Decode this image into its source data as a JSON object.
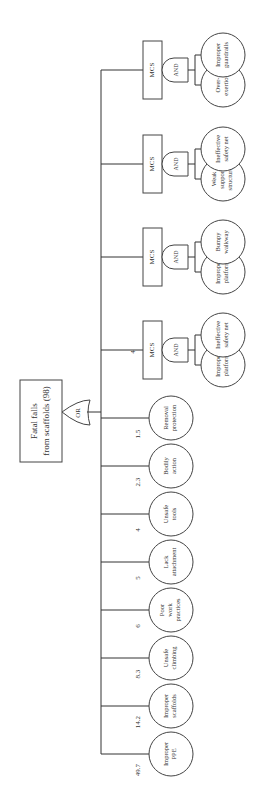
{
  "diagram": {
    "type": "fault-tree",
    "orientation": "rotated-90-ccw",
    "top_event": {
      "line1": "Fatal falls",
      "line2": "from scaffolds (98)"
    },
    "top_gate": "OR",
    "basic_events": [
      {
        "lines": [
          "Improper",
          "PPE"
        ],
        "value": "49.7"
      },
      {
        "lines": [
          "Improper",
          "scaffolds"
        ],
        "value": "14.2"
      },
      {
        "lines": [
          "Unsafe",
          "climbing"
        ],
        "value": "8.3"
      },
      {
        "lines": [
          "Poor",
          "work",
          "practices"
        ],
        "value": "6"
      },
      {
        "lines": [
          "Lack",
          "attachment"
        ],
        "value": "5"
      },
      {
        "lines": [
          "Unsafe",
          "tools"
        ],
        "value": "4"
      },
      {
        "lines": [
          "Bodily",
          "action"
        ],
        "value": "2.3"
      },
      {
        "lines": [
          "Removal",
          "protection"
        ],
        "value": "1.5"
      }
    ],
    "mcs_value": "4",
    "mcs": [
      {
        "label": "MCS",
        "gate": "AND",
        "children": [
          {
            "lines": [
              "Improper",
              "platform"
            ]
          },
          {
            "lines": [
              "Ineffective",
              "safety net"
            ]
          }
        ]
      },
      {
        "label": "MCS",
        "gate": "AND",
        "children": [
          {
            "lines": [
              "Improper",
              "platform"
            ]
          },
          {
            "lines": [
              "Bumpy",
              "walkway"
            ]
          }
        ]
      },
      {
        "label": "MCS",
        "gate": "AND",
        "children": [
          {
            "lines": [
              "Weak",
              "support",
              "structure"
            ]
          },
          {
            "lines": [
              "Ineffective",
              "safety net"
            ]
          }
        ]
      },
      {
        "label": "MCS",
        "gate": "AND",
        "children": [
          {
            "lines": [
              "Over-",
              "exertion"
            ]
          },
          {
            "lines": [
              "Improper",
              "guardrails"
            ]
          }
        ]
      }
    ]
  }
}
